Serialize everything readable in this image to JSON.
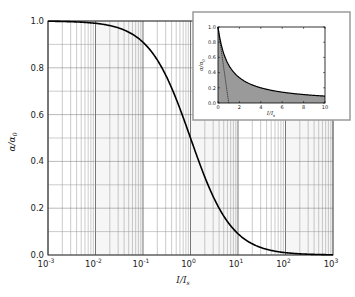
{
  "chart_data": [
    {
      "type": "line",
      "title": "",
      "xlabel": "I / I_s",
      "ylabel": "α / α_0",
      "xscale": "log",
      "xlim": [
        0.001,
        1000
      ],
      "ylim": [
        0.0,
        1.0
      ],
      "x_ticks": [
        "10^-3",
        "10^-2",
        "10^-1",
        "10^0",
        "10^1",
        "10^2",
        "10^3"
      ],
      "y_ticks": [
        "0.0",
        "0.2",
        "0.4",
        "0.6",
        "0.8",
        "1.0"
      ],
      "grid": true,
      "series": [
        {
          "name": "α/α0 = 1/(1 + I/Is)",
          "x": [
            0.001,
            0.01,
            0.1,
            0.3,
            1,
            3,
            10,
            100,
            1000
          ],
          "values": [
            0.999,
            0.99,
            0.909,
            0.769,
            0.5,
            0.25,
            0.091,
            0.0099,
            0.001
          ]
        }
      ],
      "color": "#000000"
    },
    {
      "type": "area",
      "title": "inset",
      "xlabel": "I / I_s",
      "ylabel": "α / α_0",
      "xscale": "linear",
      "xlim": [
        0,
        10
      ],
      "ylim": [
        0.0,
        1.0
      ],
      "x_ticks": [
        "0",
        "2",
        "4",
        "6",
        "8",
        "10"
      ],
      "y_ticks": [
        "0.0",
        "0.2",
        "0.4",
        "0.6",
        "0.8",
        "1.0"
      ],
      "series": [
        {
          "name": "α/α0 = 1/(1 + I/Is) (shaded)",
          "x": [
            0,
            1,
            2,
            4,
            6,
            8,
            10
          ],
          "values": [
            1.0,
            0.5,
            0.333,
            0.2,
            0.143,
            0.111,
            0.091
          ]
        },
        {
          "name": "dotted tangent line",
          "x": [
            0,
            1
          ],
          "values": [
            1.0,
            0.0
          ]
        }
      ],
      "fill_color": "#9a9a9a"
    }
  ],
  "labels": {
    "main_xlabel_i": "I",
    "main_xlabel_s": "s",
    "main_ylabel": "α/α",
    "main_ylabel_sub": "0",
    "inset_xlabel": "I",
    "inset_xlabel_s": "s",
    "inset_ylabel": "α/α",
    "inset_ylabel_sub": "0"
  }
}
